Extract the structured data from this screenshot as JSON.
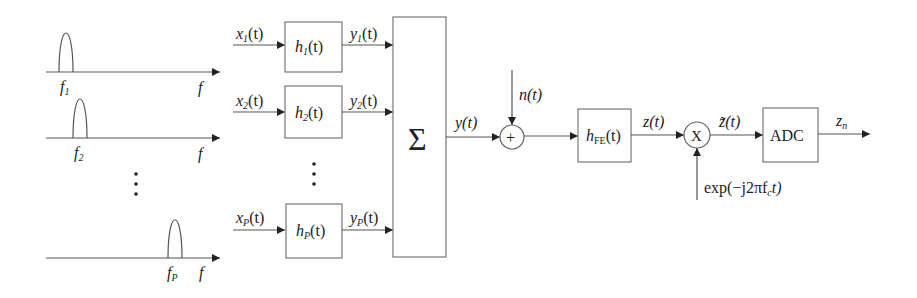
{
  "diagram": {
    "type": "block-diagram",
    "spectra": [
      {
        "id": "band-1",
        "center_label": "f",
        "center_sub": "1",
        "axis_label": "f"
      },
      {
        "id": "band-2",
        "center_label": "f",
        "center_sub": "2",
        "axis_label": "f"
      },
      {
        "id": "band-P",
        "center_label": "f",
        "center_sub": "P",
        "axis_label": "f"
      }
    ],
    "ellipsis": "⋮",
    "filters": [
      {
        "input": "x",
        "input_sub": "1",
        "label": "h",
        "label_sub": "1",
        "output": "y",
        "output_sub": "1"
      },
      {
        "input": "x",
        "input_sub": "2",
        "label": "h",
        "label_sub": "2",
        "output": "y",
        "output_sub": "2"
      },
      {
        "input": "x",
        "input_sub": "P",
        "label": "h",
        "label_sub": "P",
        "output": "y",
        "output_sub": "P"
      }
    ],
    "arg": "(t)",
    "sum_symbol": "Σ",
    "sum_output": "y(t)",
    "noise": "n(t)",
    "adder_symbol": "+",
    "frontend": {
      "label": "h",
      "label_sub": "FE",
      "arg": "(t)"
    },
    "frontend_output": "z(t)",
    "mixer_symbol": "X",
    "mixer_input": "exp(−j2πf",
    "mixer_input_sub": "c",
    "mixer_input_tail": "t)",
    "mixer_output": "z̃(t)",
    "adc_label": "ADC",
    "output": "z",
    "output_sub": "n"
  }
}
